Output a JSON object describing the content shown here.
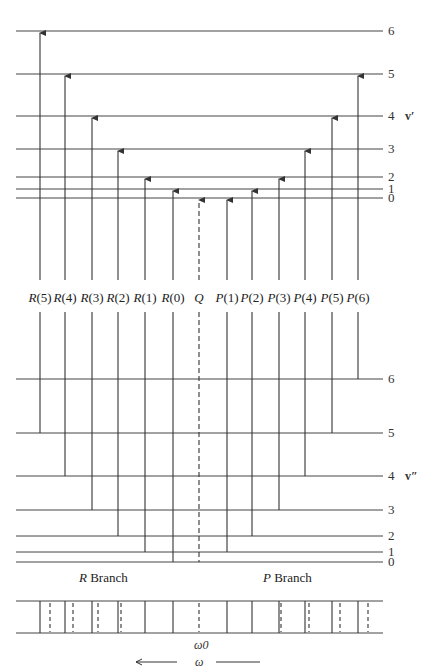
{
  "diagram": {
    "upper_state": {
      "symbol": "v′",
      "levels": [
        {
          "j": "0",
          "y": 198
        },
        {
          "j": "1",
          "y": 189
        },
        {
          "j": "2",
          "y": 177
        },
        {
          "j": "3",
          "y": 149
        },
        {
          "j": "4",
          "y": 116
        },
        {
          "j": "5",
          "y": 74
        },
        {
          "j": "6",
          "y": 31
        }
      ]
    },
    "lower_state": {
      "symbol": "v″",
      "levels": [
        {
          "j": "0",
          "y": 562
        },
        {
          "j": "1",
          "y": 552
        },
        {
          "j": "2",
          "y": 536
        },
        {
          "j": "3",
          "y": 510
        },
        {
          "j": "4",
          "y": 476
        },
        {
          "j": "5",
          "y": 433
        },
        {
          "j": "6",
          "y": 379
        }
      ]
    },
    "transitions": [
      {
        "branch": "R",
        "label": "R",
        "arg": "(5)",
        "x": 40,
        "from_j": 5,
        "to_j": 6,
        "dashed": false
      },
      {
        "branch": "R",
        "label": "R",
        "arg": "(4)",
        "x": 65,
        "from_j": 4,
        "to_j": 5,
        "dashed": false
      },
      {
        "branch": "R",
        "label": "R",
        "arg": "(3)",
        "x": 92,
        "from_j": 3,
        "to_j": 4,
        "dashed": false
      },
      {
        "branch": "R",
        "label": "R",
        "arg": "(2)",
        "x": 118,
        "from_j": 2,
        "to_j": 3,
        "dashed": false
      },
      {
        "branch": "R",
        "label": "R",
        "arg": "(1)",
        "x": 145,
        "from_j": 1,
        "to_j": 2,
        "dashed": false
      },
      {
        "branch": "R",
        "label": "R",
        "arg": "(0)",
        "x": 173,
        "from_j": 0,
        "to_j": 1,
        "dashed": false
      },
      {
        "branch": "Q",
        "label": "Q",
        "arg": "",
        "x": 199,
        "from_j": 0,
        "to_j": 0,
        "dashed": true
      },
      {
        "branch": "P",
        "label": "P",
        "arg": "(1)",
        "x": 227,
        "from_j": 1,
        "to_j": 0,
        "dashed": false
      },
      {
        "branch": "P",
        "label": "P",
        "arg": "(2)",
        "x": 252,
        "from_j": 2,
        "to_j": 1,
        "dashed": false
      },
      {
        "branch": "P",
        "label": "P",
        "arg": "(3)",
        "x": 279,
        "from_j": 3,
        "to_j": 2,
        "dashed": false
      },
      {
        "branch": "P",
        "label": "P",
        "arg": "(4)",
        "x": 305,
        "from_j": 4,
        "to_j": 3,
        "dashed": false
      },
      {
        "branch": "P",
        "label": "P",
        "arg": "(5)",
        "x": 332,
        "from_j": 5,
        "to_j": 4,
        "dashed": false
      },
      {
        "branch": "P",
        "label": "P",
        "arg": "(6)",
        "x": 358,
        "from_j": 6,
        "to_j": 5,
        "dashed": false
      }
    ],
    "branch_labels": {
      "r_letter": "R",
      "r_word": " Branch",
      "p_letter": "P",
      "p_word": " Branch"
    },
    "spectrum": {
      "solid_lines_x": [
        40,
        65,
        92,
        118,
        145,
        173,
        227,
        252,
        279,
        305,
        332,
        358
      ],
      "dashed_lines_x": [
        50,
        73,
        98,
        121,
        199,
        281,
        309,
        340,
        368
      ],
      "center_label": "ω0",
      "axis_label": "ω"
    },
    "colors": {
      "line": "#333333",
      "background": "#ffffff"
    }
  }
}
